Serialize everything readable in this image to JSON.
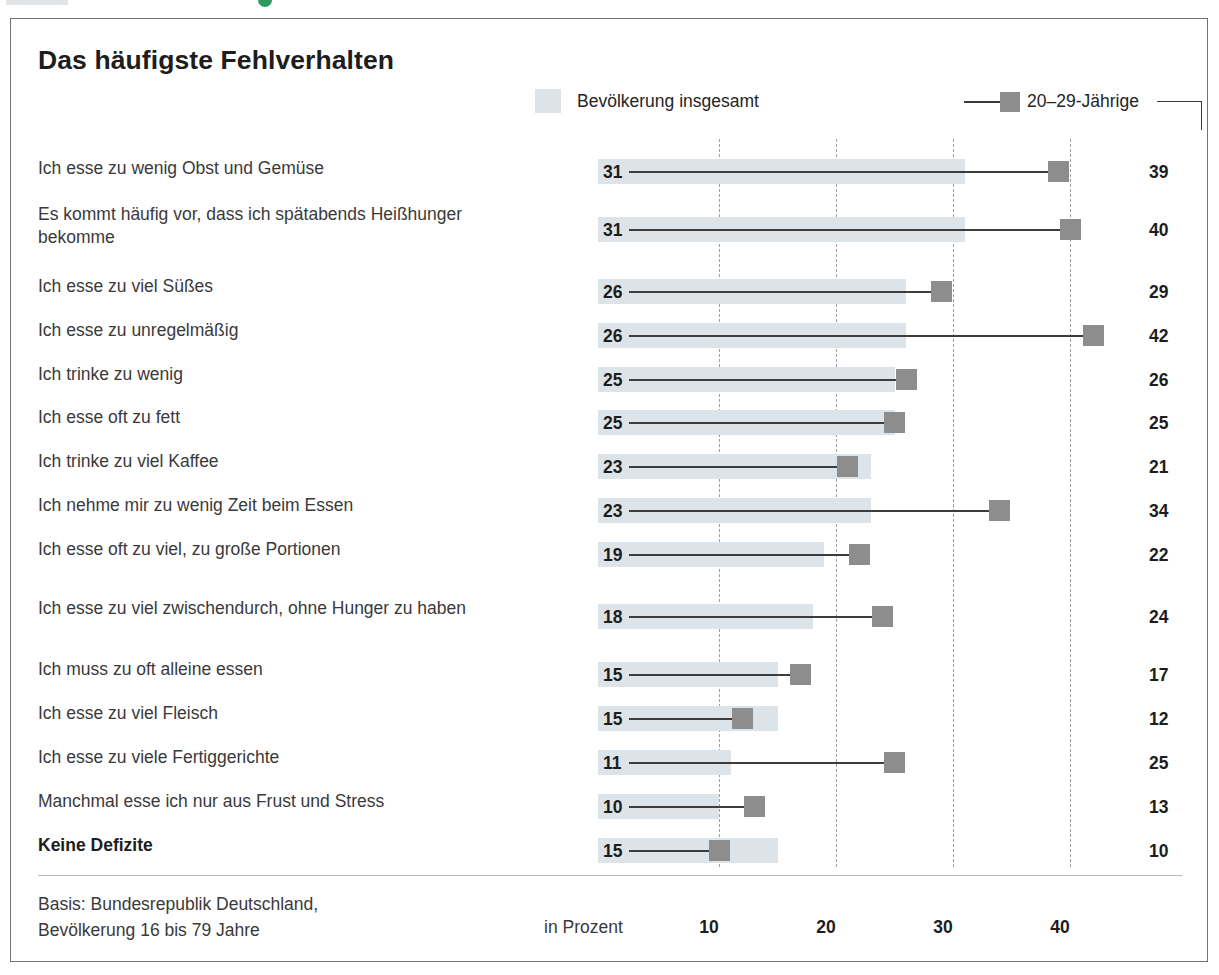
{
  "card": {
    "title": "Das häufigste Fehlverhalten",
    "unit_label": "in Prozent",
    "basis_line1": "Basis: Bundesrepublik Deutschland,",
    "basis_line2": "Bevölkerung 16 bis 79 Jahre"
  },
  "legend": {
    "series_total": "Bevölkerung insgesamt",
    "series_young": "20–29-Jährige"
  },
  "colors": {
    "bar_total": "#dde4e9",
    "marker_young": "#8d8d8d",
    "connector": "#3d3d3d",
    "gridline": "#9aa0a6",
    "card_border": "#6e7378",
    "green_accent": "#2e9a5f"
  },
  "chart_data": {
    "type": "bar",
    "title": "Das häufigste Fehlverhalten",
    "xlabel": "in Prozent",
    "ylabel": "",
    "xlim": [
      0,
      45
    ],
    "xticks": [
      10,
      20,
      30,
      40
    ],
    "xtick_labels": [
      "10",
      "20",
      "30",
      "40"
    ],
    "grid": "vertical-dashed",
    "legend_position": "top",
    "orientation": "horizontal",
    "categories": [
      "Ich esse zu wenig Obst und Gemüse",
      "Es kommt häufig vor, dass ich spätabends Heißhunger bekomme",
      "Ich esse zu viel Süßes",
      "Ich esse zu unregelmäßig",
      "Ich trinke zu wenig",
      "Ich esse oft zu fett",
      "Ich trinke zu viel Kaffee",
      "Ich nehme mir zu wenig Zeit beim Essen",
      "Ich esse oft zu viel, zu große Portionen",
      "Ich esse zu viel zwischendurch, ohne Hunger zu haben",
      "Ich muss zu oft alleine essen",
      "Ich esse zu viel Fleisch",
      "Ich esse zu viele Fertiggerichte",
      "Manchmal esse ich nur aus Frust und Stress",
      "Keine Defizite"
    ],
    "series": [
      {
        "name": "Bevölkerung insgesamt",
        "values": [
          31,
          31,
          26,
          26,
          25,
          25,
          23,
          23,
          19,
          18,
          15,
          15,
          11,
          10,
          15
        ]
      },
      {
        "name": "20–29-Jährige",
        "values": [
          39,
          40,
          29,
          42,
          26,
          25,
          21,
          34,
          22,
          24,
          17,
          12,
          25,
          13,
          10
        ]
      }
    ]
  },
  "rows": [
    {
      "label": "Ich esse zu wenig Obst und Gemüse",
      "total": "31",
      "young": "39",
      "bold": false
    },
    {
      "label": "Es kommt häufig vor, dass ich spätabends Heißhunger bekomme",
      "total": "31",
      "young": "40",
      "bold": false
    },
    {
      "label": "Ich esse zu viel Süßes",
      "total": "26",
      "young": "29",
      "bold": false
    },
    {
      "label": "Ich esse zu unregelmäßig",
      "total": "26",
      "young": "42",
      "bold": false
    },
    {
      "label": "Ich trinke zu wenig",
      "total": "25",
      "young": "26",
      "bold": false
    },
    {
      "label": "Ich esse oft zu fett",
      "total": "25",
      "young": "25",
      "bold": false
    },
    {
      "label": "Ich trinke zu viel Kaffee",
      "total": "23",
      "young": "21",
      "bold": false
    },
    {
      "label": "Ich nehme mir zu wenig Zeit beim Essen",
      "total": "23",
      "young": "34",
      "bold": false
    },
    {
      "label": "Ich esse oft zu viel, zu große Portionen",
      "total": "19",
      "young": "22",
      "bold": false
    },
    {
      "label": "Ich esse zu viel zwischendurch, ohne Hunger zu haben",
      "total": "18",
      "young": "24",
      "bold": false
    },
    {
      "label": "Ich muss zu oft alleine essen",
      "total": "15",
      "young": "17",
      "bold": false
    },
    {
      "label": "Ich esse zu viel Fleisch",
      "total": "15",
      "young": "12",
      "bold": false
    },
    {
      "label": "Ich esse zu viele Fertiggerichte",
      "total": "11",
      "young": "25",
      "bold": false
    },
    {
      "label": "Manchmal esse ich nur aus Frust und Stress",
      "total": "10",
      "young": "13",
      "bold": false
    },
    {
      "label": "Keine Defizite",
      "total": "15",
      "young": "10",
      "bold": true
    }
  ]
}
